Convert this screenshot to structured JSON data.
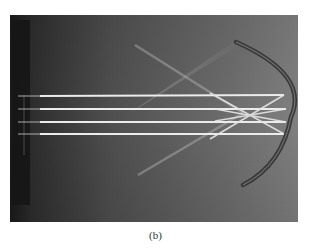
{
  "figure": {
    "caption": "(b)",
    "photo": {
      "subject": "parallel light rays reflecting off a concave mirror and converging at a focal point",
      "beam_count": 4,
      "colors": {
        "background_dark": "#1e1e1e",
        "background_mid": "#5a5a5a",
        "background_light": "#7e7e7e",
        "beam": "#ececec",
        "mirror": "#3a3a3a",
        "page": "#ffffff"
      }
    }
  }
}
